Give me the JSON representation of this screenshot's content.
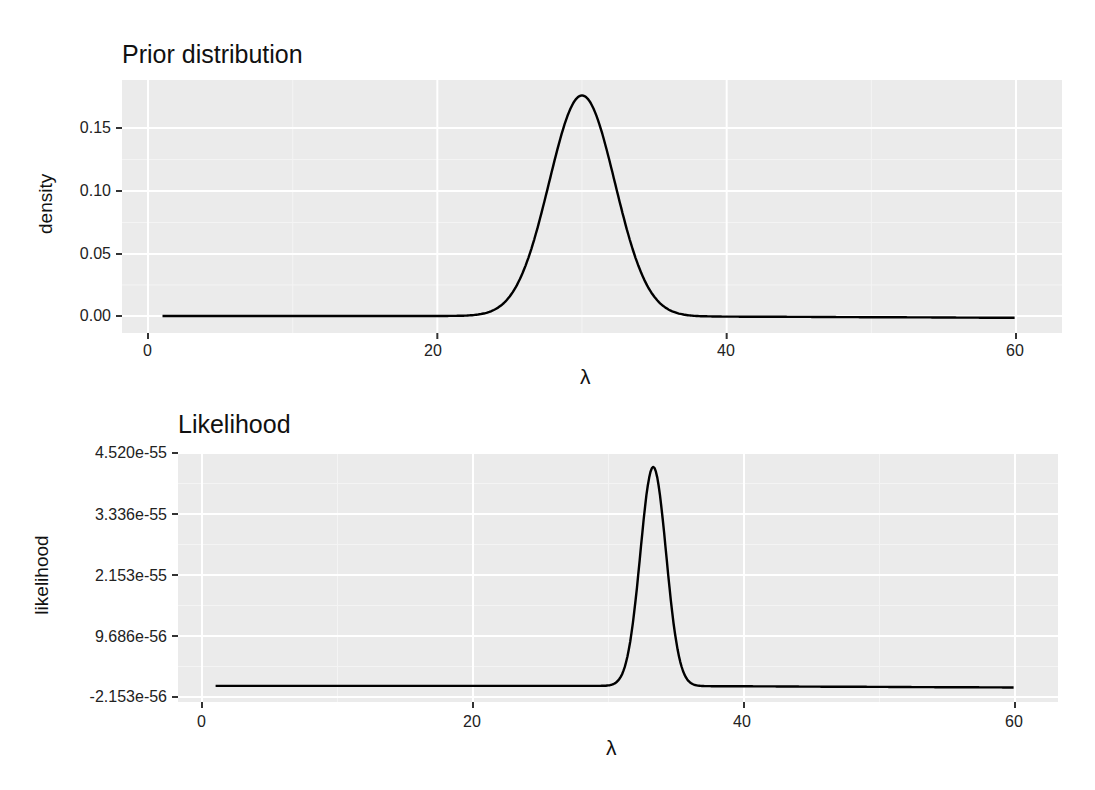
{
  "chart_data": [
    {
      "type": "line",
      "title": "Prior distribution",
      "xlabel": "λ",
      "ylabel": "density",
      "xlim": [
        0,
        62
      ],
      "ylim": [
        -0.01,
        0.18
      ],
      "x_ticks": [
        0,
        20,
        40,
        60
      ],
      "x_tick_labels": [
        "0",
        "20",
        "40",
        "60"
      ],
      "y_ticks": [
        0.0,
        0.05,
        0.1,
        0.15
      ],
      "y_tick_labels": [
        "0.00",
        "0.05",
        "0.10",
        "0.15"
      ],
      "grid": true,
      "series": [
        {
          "name": "prior",
          "distribution_shape": "bell",
          "mean": 30,
          "sd": 2.27,
          "peak_x": 30,
          "peak_y": 0.176,
          "x": [
            1,
            10,
            20,
            23,
            24,
            25,
            26,
            27,
            28,
            29,
            30,
            31,
            32,
            33,
            34,
            35,
            36,
            37,
            40,
            50,
            60
          ],
          "y": [
            0.0,
            0.0,
            0.0,
            0.0015,
            0.0054,
            0.016,
            0.037,
            0.073,
            0.119,
            0.16,
            0.176,
            0.16,
            0.119,
            0.073,
            0.037,
            0.016,
            0.0054,
            0.0015,
            0.0,
            0.0,
            0.0
          ]
        }
      ],
      "legend": null
    },
    {
      "type": "line",
      "title": "Likelihood",
      "xlabel": "λ",
      "ylabel": "likelihood",
      "xlim": [
        0,
        62
      ],
      "ylim": [
        -2.153e-56,
        4.52e-55
      ],
      "x_ticks": [
        0,
        20,
        40,
        60
      ],
      "x_tick_labels": [
        "0",
        "20",
        "40",
        "60"
      ],
      "y_ticks": [
        -2.153e-56,
        9.686e-56,
        2.153e-55,
        3.336e-55,
        4.52e-55
      ],
      "y_tick_labels": [
        "-2.153e-56",
        "9.686e-56",
        "2.153e-55",
        "3.336e-55",
        "4.520e-55"
      ],
      "grid": true,
      "series": [
        {
          "name": "likelihood",
          "distribution_shape": "bell",
          "peak_x": 33.3,
          "peak_y": 4.25e-55,
          "sd": 0.95,
          "x": [
            1,
            10,
            20,
            30,
            31,
            31.5,
            32,
            32.5,
            33,
            33.3,
            33.6,
            34,
            34.5,
            35,
            35.5,
            36,
            37,
            40,
            50,
            60
          ],
          "y": [
            0.0,
            0.0,
            0.0,
            1e-57,
            2.4e-57,
            7.5e-56,
            1.4e-55,
            2.9e-55,
            4e-55,
            4.25e-55,
            4e-55,
            3.1e-55,
            1.8e-55,
            8e-56,
            2.8e-56,
            8e-57,
            0.0,
            0.0,
            0.0,
            0.0
          ]
        }
      ],
      "legend": null
    }
  ],
  "panels": {
    "prior": {
      "title": "Prior distribution",
      "ylabel": "density",
      "xlabel": "λ",
      "y_ticks": [
        "0.15",
        "0.10",
        "0.05",
        "0.00"
      ],
      "x_ticks": [
        "0",
        "20",
        "40",
        "60"
      ]
    },
    "likelihood": {
      "title": "Likelihood",
      "ylabel": "likelihood",
      "xlabel": "λ",
      "y_ticks": [
        "4.520e-55",
        "3.336e-55",
        "2.153e-55",
        "9.686e-56",
        "-2.153e-56"
      ],
      "x_ticks": [
        "0",
        "20",
        "40",
        "60"
      ]
    }
  },
  "colors": {
    "panel_background": "#ebebeb",
    "grid_major": "#ffffff",
    "line": "#000000",
    "text": "#1a1a1a"
  }
}
